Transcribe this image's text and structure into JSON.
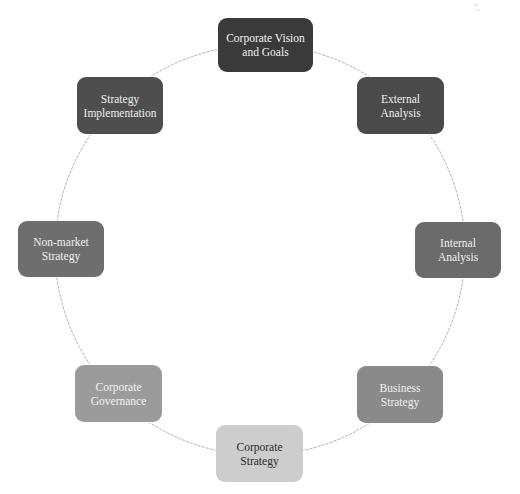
{
  "diagram": {
    "type": "cycle",
    "title": "",
    "ring": {
      "cx": 260,
      "cy": 250,
      "r": 205,
      "stroke": "#9a9a9a"
    },
    "nodes": [
      {
        "id": "corporate-vision",
        "label": "Corporate Vision\nand Goals",
        "x": 218,
        "y": 18,
        "w": 95,
        "h": 54,
        "fill": "#3a3a3a",
        "text_color": "#f2f2f2"
      },
      {
        "id": "external-analysis",
        "label": "External\nAnalysis",
        "x": 357,
        "y": 77,
        "w": 87,
        "h": 57,
        "fill": "#4a4a4a",
        "text_color": "#eeeeee"
      },
      {
        "id": "internal-analysis",
        "label": "Internal Analysis",
        "x": 415,
        "y": 222,
        "w": 86,
        "h": 56,
        "fill": "#6b6b6b",
        "text_color": "#efefef"
      },
      {
        "id": "business-strategy",
        "label": "Business\nStrategy",
        "x": 357,
        "y": 366,
        "w": 86,
        "h": 57,
        "fill": "#8a8a8a",
        "text_color": "#f0f0f0"
      },
      {
        "id": "corporate-strategy",
        "label": "Corporate\nStrategy",
        "x": 216,
        "y": 425,
        "w": 87,
        "h": 57,
        "fill": "#cdcdcd",
        "text_color": "#2a2a2a"
      },
      {
        "id": "corporate-governance",
        "label": "Corporate\nGovernance",
        "x": 75,
        "y": 365,
        "w": 87,
        "h": 57,
        "fill": "#9b9b9b",
        "text_color": "#f2f2f2"
      },
      {
        "id": "non-market-strategy",
        "label": "Non-market\nStrategy",
        "x": 18,
        "y": 221,
        "w": 86,
        "h": 56,
        "fill": "#6e6e6e",
        "text_color": "#efefef"
      },
      {
        "id": "strategy-implementation",
        "label": "Strategy\nImplementation",
        "x": 77,
        "y": 77,
        "w": 86,
        "h": 57,
        "fill": "#4e4e4e",
        "text_color": "#efefef"
      }
    ]
  }
}
